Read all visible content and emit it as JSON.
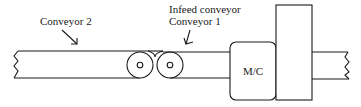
{
  "diagram": {
    "type": "conveyor-layout",
    "labels": {
      "conveyor2": "Conveyor 2",
      "infeed_line1": "Infeed conveyor",
      "infeed_line2": "Conveyor 1",
      "machine": "M/C"
    },
    "colors": {
      "stroke": "#1a1a1a",
      "background": "#ffffff"
    }
  }
}
